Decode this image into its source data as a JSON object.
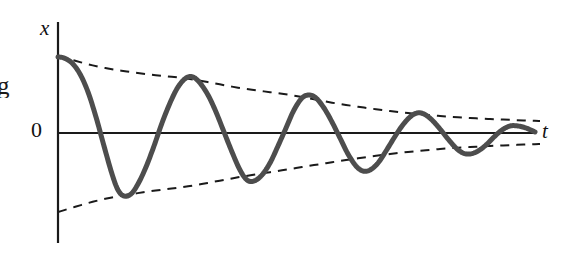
{
  "figure": {
    "kind": "damped-oscillation-plot",
    "background_color": "#ffffff",
    "labels": {
      "y_axis": "x",
      "x_axis": "t",
      "origin": "0",
      "margin_fragment": "g"
    },
    "colors": {
      "curve": "#4d4d4d",
      "axis": "#1a1a1a",
      "envelope": "#1a1a1a",
      "text": "#111111"
    }
  },
  "chart_data": {
    "type": "line",
    "title": "",
    "subtitle": "",
    "xlabel": "t",
    "ylabel": "x",
    "grid": false,
    "legend": false,
    "annotations": [
      "0"
    ],
    "axes": {
      "x_axis_y_px": 133,
      "y_axis_x_px": 58,
      "y_axis_top_px": 22,
      "y_axis_bottom_px": 243,
      "x_axis_end_px": 535
    },
    "series": [
      {
        "name": "damped-oscillation",
        "style": "solid",
        "color": "#4d4d4d",
        "width_px": 5,
        "points_px": [
          [
            58,
            57
          ],
          [
            64,
            58
          ],
          [
            72,
            63
          ],
          [
            80,
            74
          ],
          [
            88,
            92
          ],
          [
            96,
            117
          ],
          [
            104,
            146
          ],
          [
            112,
            174
          ],
          [
            118,
            190
          ],
          [
            124,
            196
          ],
          [
            131,
            194
          ],
          [
            138,
            184
          ],
          [
            146,
            167
          ],
          [
            154,
            146
          ],
          [
            162,
            123
          ],
          [
            170,
            103
          ],
          [
            178,
            87
          ],
          [
            186,
            78
          ],
          [
            193,
            77
          ],
          [
            200,
            83
          ],
          [
            208,
            95
          ],
          [
            216,
            112
          ],
          [
            224,
            132
          ],
          [
            232,
            152
          ],
          [
            240,
            170
          ],
          [
            247,
            180
          ],
          [
            254,
            181
          ],
          [
            262,
            175
          ],
          [
            270,
            163
          ],
          [
            278,
            146
          ],
          [
            286,
            128
          ],
          [
            294,
            110
          ],
          [
            302,
            98
          ],
          [
            309,
            95
          ],
          [
            316,
            98
          ],
          [
            324,
            108
          ],
          [
            332,
            122
          ],
          [
            340,
            138
          ],
          [
            348,
            154
          ],
          [
            356,
            166
          ],
          [
            363,
            171
          ],
          [
            370,
            170
          ],
          [
            378,
            163
          ],
          [
            386,
            151
          ],
          [
            394,
            138
          ],
          [
            402,
            126
          ],
          [
            410,
            117
          ],
          [
            417,
            113
          ],
          [
            424,
            114
          ],
          [
            432,
            120
          ],
          [
            440,
            129
          ],
          [
            448,
            139
          ],
          [
            456,
            148
          ],
          [
            463,
            153
          ],
          [
            470,
            154
          ],
          [
            478,
            151
          ],
          [
            486,
            145
          ],
          [
            494,
            137
          ],
          [
            502,
            130
          ],
          [
            510,
            126
          ],
          [
            518,
            126
          ],
          [
            526,
            128
          ],
          [
            535,
            132
          ]
        ]
      },
      {
        "name": "upper-envelope",
        "style": "dashed",
        "color": "#1a1a1a",
        "width_px": 2,
        "dash_px": [
          9,
          7
        ],
        "points_px": [
          [
            58,
            56
          ],
          [
            100,
            67
          ],
          [
            145,
            74
          ],
          [
            190,
            79
          ],
          [
            240,
            88
          ],
          [
            290,
            95
          ],
          [
            340,
            104
          ],
          [
            390,
            111
          ],
          [
            440,
            116
          ],
          [
            490,
            119
          ],
          [
            540,
            121
          ]
        ]
      },
      {
        "name": "lower-envelope",
        "style": "dashed",
        "color": "#1a1a1a",
        "width_px": 2,
        "dash_px": [
          9,
          7
        ],
        "points_px": [
          [
            58,
            212
          ],
          [
            100,
            200
          ],
          [
            145,
            192
          ],
          [
            190,
            186
          ],
          [
            240,
            177
          ],
          [
            290,
            169
          ],
          [
            340,
            161
          ],
          [
            390,
            154
          ],
          [
            440,
            149
          ],
          [
            490,
            146
          ],
          [
            540,
            144
          ]
        ]
      }
    ],
    "extrema_px": {
      "peaks": [
        [
          58,
          57
        ],
        [
          193,
          77
        ],
        [
          309,
          95
        ],
        [
          417,
          113
        ],
        [
          515,
          126
        ]
      ],
      "troughs": [
        [
          120,
          195
        ],
        [
          250,
          181
        ],
        [
          364,
          171
        ],
        [
          466,
          154
        ]
      ]
    }
  }
}
